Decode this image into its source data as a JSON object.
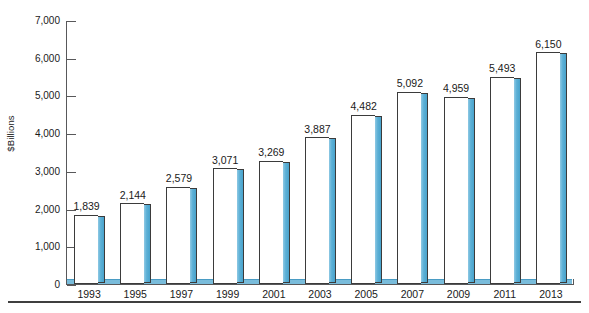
{
  "chart_data": {
    "type": "bar",
    "title": "",
    "subtitle": "",
    "xlabel": "",
    "ylabel": "$Billions",
    "categories": [
      "1993",
      "1995",
      "1997",
      "1999",
      "2001",
      "2003",
      "2005",
      "2007",
      "2009",
      "2011",
      "2013"
    ],
    "values": [
      1839,
      2144,
      2579,
      3071,
      3269,
      3887,
      4482,
      5092,
      4959,
      5493,
      6150
    ],
    "value_labels": [
      "1,839",
      "2,144",
      "2,579",
      "3,071",
      "3,269",
      "3,887",
      "4,482",
      "5,092",
      "4,959",
      "5,493",
      "6,150"
    ],
    "ylim": [
      0,
      7000
    ],
    "ytick_values": [
      0,
      1000,
      2000,
      3000,
      4000,
      5000,
      6000,
      7000
    ],
    "ytick_labels": [
      "0",
      "1,000",
      "2,000",
      "3,000",
      "4,000",
      "5,000",
      "6,000",
      "7,000"
    ],
    "grid": false,
    "legend": "none",
    "bar_face_color": "#ffffff",
    "bar_outline_color": "#3b3b3b",
    "bar_side_color": "#5cb0d6",
    "axis_color": "#58585a"
  },
  "footnote": ""
}
